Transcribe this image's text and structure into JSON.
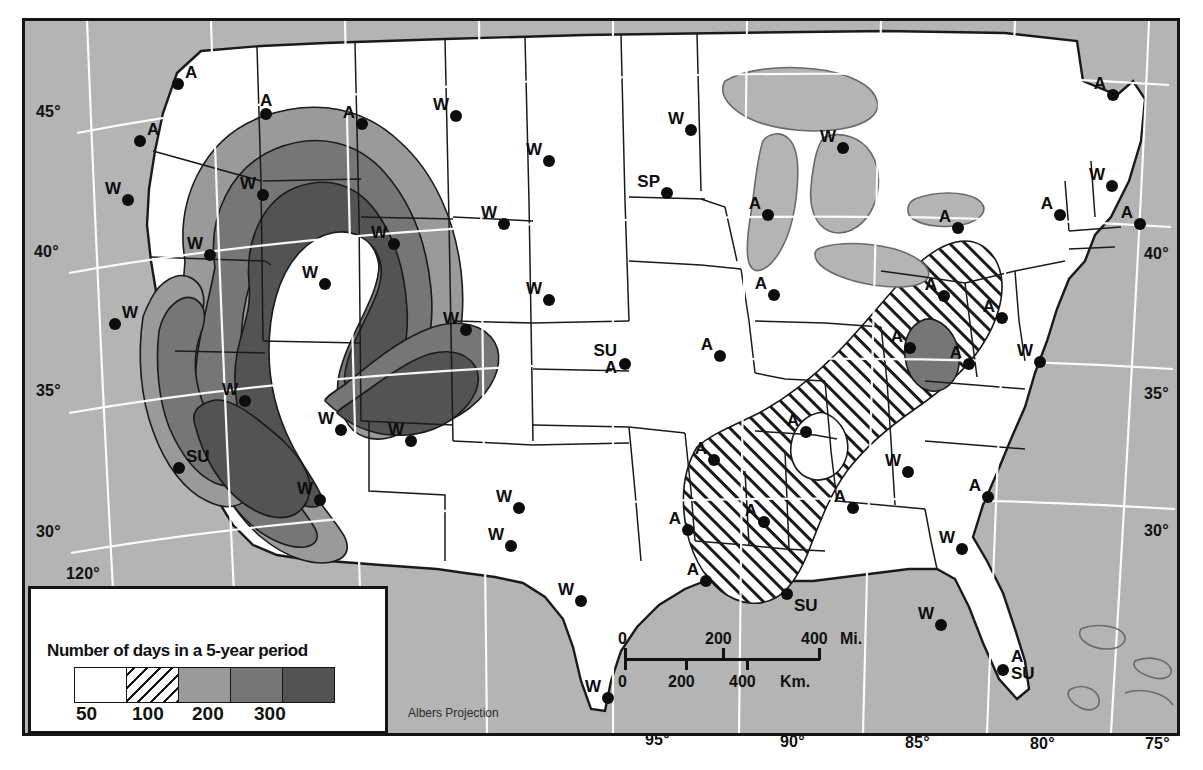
{
  "map": {
    "projection_note": "Albers Projection",
    "background_color": "#b4b4b4",
    "land_color": "#ffffff",
    "line_color": "#141414",
    "graticule_color": "#ffffff"
  },
  "legend": {
    "title": "Number of days in a 5-year period",
    "classes": [
      {
        "label": "",
        "fill": "#ffffff",
        "name": "under-50"
      },
      {
        "label": "50",
        "fill": "hatch",
        "name": "50-100"
      },
      {
        "label": "100",
        "fill": "#9a9a9a",
        "name": "100-200"
      },
      {
        "label": "200",
        "fill": "#767676",
        "name": "200-300"
      },
      {
        "label": "300",
        "fill": "#535353",
        "name": "over-300"
      }
    ],
    "tick_labels": [
      "50",
      "100",
      "200",
      "300"
    ]
  },
  "scale": {
    "miles": {
      "ticks": [
        "0",
        "200",
        "400"
      ],
      "unit": "Mi."
    },
    "kilometers": {
      "ticks": [
        "0",
        "200",
        "400"
      ],
      "unit": "Km."
    }
  },
  "graticule": {
    "latitudes_left": [
      {
        "label": "45°",
        "x": 36,
        "y": 103
      },
      {
        "label": "40°",
        "x": 34,
        "y": 243
      },
      {
        "label": "35°",
        "x": 36,
        "y": 382
      },
      {
        "label": "30°",
        "x": 36,
        "y": 523
      }
    ],
    "latitudes_right": [
      {
        "label": "40°",
        "x": 1144,
        "y": 245
      },
      {
        "label": "35°",
        "x": 1144,
        "y": 385
      },
      {
        "label": "30°",
        "x": 1144,
        "y": 522
      }
    ],
    "longitudes_bottom": [
      {
        "label": "95°",
        "x": 645,
        "y": 731
      },
      {
        "label": "90°",
        "x": 780,
        "y": 733
      },
      {
        "label": "85°",
        "x": 905,
        "y": 734
      },
      {
        "label": "80°",
        "x": 1030,
        "y": 735
      },
      {
        "label": "75°",
        "x": 1145,
        "y": 735
      }
    ],
    "longitudes_other": [
      {
        "label": "120°",
        "x": 66,
        "y": 565
      }
    ]
  },
  "stations": [
    {
      "label": "A",
      "x": 178,
      "y": 84,
      "pos": "ne",
      "name": "station-seattle"
    },
    {
      "label": "A",
      "x": 140,
      "y": 141,
      "pos": "ne",
      "name": "station-portland"
    },
    {
      "label": "A",
      "x": 266,
      "y": 114,
      "pos": "n",
      "name": "station-spokane"
    },
    {
      "label": "A",
      "x": 362,
      "y": 124,
      "pos": "nw",
      "name": "station-montana-west"
    },
    {
      "label": "W",
      "x": 456,
      "y": 116,
      "pos": "nw",
      "name": "station-montana-east"
    },
    {
      "label": "W",
      "x": 549,
      "y": 161,
      "pos": "nw",
      "name": "station-north-dakota"
    },
    {
      "label": "W",
      "x": 691,
      "y": 130,
      "pos": "nw",
      "name": "station-minnesota-north"
    },
    {
      "label": "SP",
      "x": 667,
      "y": 193,
      "pos": "nw",
      "name": "station-minneapolis"
    },
    {
      "label": "W",
      "x": 843,
      "y": 148,
      "pos": "nw",
      "name": "station-sault-ste-marie"
    },
    {
      "label": "A",
      "x": 1113,
      "y": 95,
      "pos": "nw",
      "name": "station-maine"
    },
    {
      "label": "W",
      "x": 128,
      "y": 200,
      "pos": "nw",
      "name": "station-oregon-east"
    },
    {
      "label": "W",
      "x": 263,
      "y": 195,
      "pos": "nw",
      "name": "station-idaho-north"
    },
    {
      "label": "W",
      "x": 504,
      "y": 224,
      "pos": "nw",
      "name": "station-wyoming"
    },
    {
      "label": "A",
      "x": 768,
      "y": 215,
      "pos": "nw",
      "name": "station-wisconsin"
    },
    {
      "label": "A",
      "x": 958,
      "y": 228,
      "pos": "nw",
      "name": "station-buffalo"
    },
    {
      "label": "A",
      "x": 1060,
      "y": 215,
      "pos": "nw",
      "name": "station-albany"
    },
    {
      "label": "W",
      "x": 1112,
      "y": 186,
      "pos": "nw",
      "name": "station-new-hampshire"
    },
    {
      "label": "A",
      "x": 1140,
      "y": 224,
      "pos": "nw",
      "name": "station-boston"
    },
    {
      "label": "W",
      "x": 210,
      "y": 255,
      "pos": "nw",
      "name": "station-nevada-north"
    },
    {
      "label": "W",
      "x": 325,
      "y": 284,
      "pos": "nw",
      "name": "station-utah"
    },
    {
      "label": "W",
      "x": 394,
      "y": 244,
      "pos": "nw",
      "name": "station-colorado-north"
    },
    {
      "label": "W",
      "x": 549,
      "y": 300,
      "pos": "nw",
      "name": "station-nebraska"
    },
    {
      "label": "A",
      "x": 774,
      "y": 295,
      "pos": "nw",
      "name": "station-indiana"
    },
    {
      "label": "A",
      "x": 944,
      "y": 296,
      "pos": "nw",
      "name": "station-pittsburgh"
    },
    {
      "label": "A",
      "x": 1002,
      "y": 318,
      "pos": "nw",
      "name": "station-new-jersey"
    },
    {
      "label": "W",
      "x": 115,
      "y": 324,
      "pos": "ne",
      "name": "station-san-francisco"
    },
    {
      "label": "W",
      "x": 466,
      "y": 330,
      "pos": "nw",
      "name": "station-colorado-south"
    },
    {
      "label": "A",
      "x": 720,
      "y": 356,
      "pos": "nw",
      "name": "station-missouri"
    },
    {
      "label": "A",
      "x": 910,
      "y": 348,
      "pos": "nw",
      "name": "station-west-virginia"
    },
    {
      "label": "A",
      "x": 969,
      "y": 364,
      "pos": "nw",
      "name": "station-virginia"
    },
    {
      "label": "W",
      "x": 1040,
      "y": 362,
      "pos": "nw",
      "name": "station-norfolk"
    },
    {
      "label": "A",
      "x": 625,
      "y": 364,
      "pos": "stack-su-a",
      "name": "station-kansas-city"
    },
    {
      "label": "W",
      "x": 245,
      "y": 401,
      "pos": "nw",
      "name": "station-nevada-south"
    },
    {
      "label": "W",
      "x": 341,
      "y": 430,
      "pos": "nw",
      "name": "station-arizona-north"
    },
    {
      "label": "W",
      "x": 411,
      "y": 441,
      "pos": "nw",
      "name": "station-new-mexico"
    },
    {
      "label": "A",
      "x": 806,
      "y": 432,
      "pos": "nw",
      "name": "station-kentucky"
    },
    {
      "label": "W",
      "x": 908,
      "y": 472,
      "pos": "nw",
      "name": "station-carolina"
    },
    {
      "label": "A",
      "x": 988,
      "y": 497,
      "pos": "nw",
      "name": "station-charleston"
    },
    {
      "label": "SU",
      "x": 179,
      "y": 468,
      "pos": "ne",
      "name": "station-southern-california"
    },
    {
      "label": "A",
      "x": 714,
      "y": 460,
      "pos": "nw",
      "name": "station-arkansas"
    },
    {
      "label": "W",
      "x": 320,
      "y": 500,
      "pos": "nw",
      "name": "station-arizona-south"
    },
    {
      "label": "W",
      "x": 519,
      "y": 508,
      "pos": "nw",
      "name": "station-texas-north"
    },
    {
      "label": "W",
      "x": 511,
      "y": 546,
      "pos": "nw",
      "name": "station-texas-west"
    },
    {
      "label": "A",
      "x": 688,
      "y": 530,
      "pos": "nw",
      "name": "station-louisiana-north"
    },
    {
      "label": "A",
      "x": 764,
      "y": 522,
      "pos": "nw",
      "name": "station-mississippi"
    },
    {
      "label": "A",
      "x": 853,
      "y": 508,
      "pos": "nw",
      "name": "station-alabama"
    },
    {
      "label": "W",
      "x": 962,
      "y": 549,
      "pos": "nw",
      "name": "station-florida-north"
    },
    {
      "label": "W",
      "x": 581,
      "y": 601,
      "pos": "nw",
      "name": "station-texas-central"
    },
    {
      "label": "A",
      "x": 706,
      "y": 581,
      "pos": "nw",
      "name": "station-houston"
    },
    {
      "label": "SU",
      "x": 787,
      "y": 594,
      "pos": "se",
      "name": "station-new-orleans"
    },
    {
      "label": "W",
      "x": 941,
      "y": 625,
      "pos": "nw",
      "name": "station-tampa"
    },
    {
      "label": "A",
      "x": 1003,
      "y": 670,
      "pos": "stack-a-su",
      "name": "station-miami"
    },
    {
      "label": "W",
      "x": 608,
      "y": 698,
      "pos": "nw",
      "name": "station-brownsville"
    }
  ]
}
